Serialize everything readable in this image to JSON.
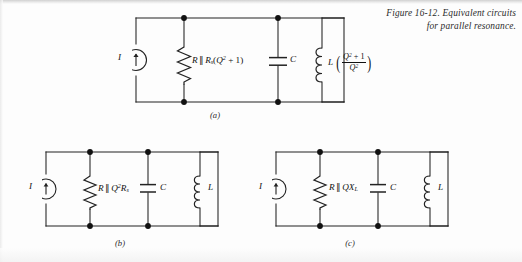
{
  "figure": {
    "caption_line1": "Figure 16-12. Equivalent circuits",
    "caption_line2": "for parallel resonance."
  },
  "circuits": [
    {
      "id": "a",
      "sublabel": "(a)",
      "source_label": "I",
      "source_icon": "current-source-arrow-up-icon",
      "resistor_icon": "resistor-zigzag-icon",
      "capacitor_icon": "capacitor-plates-icon",
      "inductor_icon": "inductor-coil-icon",
      "resistor_label": {
        "r": "R",
        "parallel": "∥",
        "rs_base": "R",
        "rs_sub": "s",
        "expr_open": "(",
        "q": "Q",
        "q_sup": "2",
        "plus_one": " + 1)"
      },
      "capacitor_label": "C",
      "inductor_label": {
        "l": "L",
        "num_q": "Q",
        "num_sup": "2",
        "num_tail": " + 1",
        "den_q": "Q",
        "den_sup": "2"
      }
    },
    {
      "id": "b",
      "sublabel": "(b)",
      "source_label": "I",
      "source_icon": "current-source-arrow-up-icon",
      "resistor_icon": "resistor-zigzag-icon",
      "capacitor_icon": "capacitor-plates-icon",
      "inductor_icon": "inductor-coil-icon",
      "resistor_label": {
        "r": "R",
        "parallel": "∥",
        "q": "Q",
        "q_sup": "2",
        "rs_base": "R",
        "rs_sub": "s"
      },
      "capacitor_label": "C",
      "inductor_label": "L"
    },
    {
      "id": "c",
      "sublabel": "(c)",
      "source_label": "I",
      "source_icon": "current-source-arrow-up-icon",
      "resistor_icon": "resistor-zigzag-icon",
      "capacitor_icon": "capacitor-plates-icon",
      "inductor_icon": "inductor-coil-icon",
      "resistor_label": {
        "r": "R",
        "parallel": "∥",
        "q": "Q",
        "x_base": "X",
        "x_sub": "L"
      },
      "capacitor_label": "C",
      "inductor_label": "L"
    }
  ],
  "colors": {
    "ink": "#111111",
    "paper": "#fdfdfd"
  }
}
